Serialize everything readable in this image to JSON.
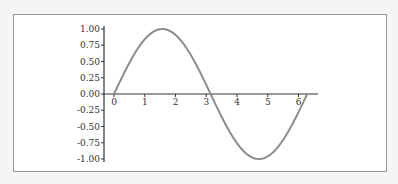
{
  "chart_data": {
    "type": "line",
    "title": "",
    "xlabel": "",
    "ylabel": "",
    "function": "sin(x)",
    "xlim": [
      0,
      6.2832
    ],
    "ylim": [
      -1.0,
      1.0
    ],
    "grid": false,
    "legend": null,
    "x_ticks": [
      "0",
      "1",
      "2",
      "3",
      "4",
      "5",
      "6"
    ],
    "y_ticks": [
      "1.00",
      "0.75",
      "0.50",
      "0.25",
      "0.00",
      "-0.25",
      "-0.50",
      "-0.75",
      "-1.00"
    ],
    "series": [
      {
        "name": "sin(x)",
        "color": "#8c8c8c",
        "x": [
          0,
          0.5,
          1.0,
          1.5708,
          2.0,
          2.5,
          3.1416,
          3.5,
          4.0,
          4.7124,
          5.0,
          5.5,
          6.2832
        ],
        "values": [
          0,
          0.479,
          0.841,
          1.0,
          0.909,
          0.598,
          0.0,
          -0.351,
          -0.757,
          -1.0,
          -0.959,
          -0.706,
          0.0
        ]
      }
    ]
  },
  "axes": {
    "x_tick_labels": [
      "0",
      "1",
      "2",
      "3",
      "4",
      "5",
      "6"
    ],
    "y_tick_labels": [
      "1.00",
      "0.75",
      "0.50",
      "0.25",
      "0.00",
      "-0.25",
      "-0.50",
      "-0.75",
      "-1.00"
    ]
  },
  "colors": {
    "line": "#8c8c8c",
    "axis": "#333333",
    "frame": "#9a9a9a"
  }
}
